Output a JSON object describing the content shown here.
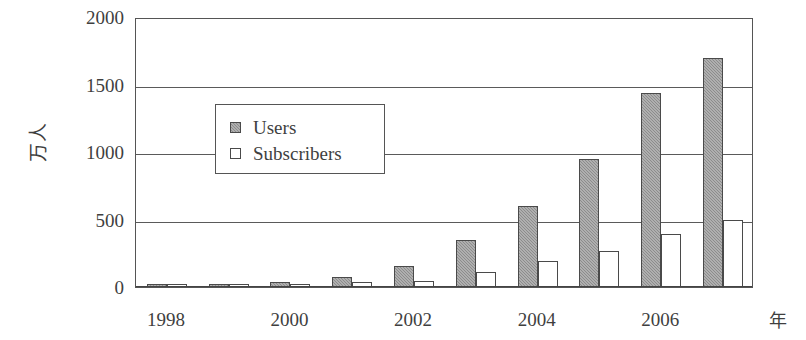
{
  "chart_data": {
    "type": "bar",
    "title": "",
    "subtitle": "",
    "xlabel": "年",
    "ylabel": "万人",
    "categories": [
      "1998",
      "1999",
      "2000",
      "2001",
      "2002",
      "2003",
      "2004",
      "2005",
      "2006",
      "2007"
    ],
    "x_tick_labels": [
      "1998",
      "2000",
      "2002",
      "2004",
      "2006"
    ],
    "series": [
      {
        "name": "Users",
        "color": "#8c8c8c",
        "values": [
          12,
          20,
          35,
          75,
          155,
          350,
          600,
          950,
          1440,
          1700
        ]
      },
      {
        "name": "Subscribers",
        "color": "#ffffff",
        "values": [
          10,
          15,
          25,
          40,
          45,
          110,
          190,
          265,
          395,
          500
        ]
      }
    ],
    "ylim": [
      0,
      2000
    ],
    "y_ticks": [
      0,
      500,
      1000,
      1500,
      2000
    ],
    "y_tick_labels": [
      "0",
      "500",
      "1000",
      "1500",
      "2000"
    ],
    "grid": true,
    "legend_position": "upper-left-inside",
    "axis_color": "#555555",
    "text_color": "#3f3f3f"
  },
  "legend": {
    "entries": [
      {
        "label": "Users",
        "style": "filled-gray"
      },
      {
        "label": "Subscribers",
        "style": "outline-white"
      }
    ]
  }
}
